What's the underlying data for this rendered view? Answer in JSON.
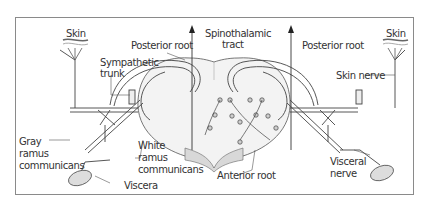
{
  "diagram": {
    "type": "anatomical cross-section of spinal cord with reflex pathways",
    "colors": {
      "frame": "#777777",
      "line": "#333333",
      "gray_matter": "#efefef",
      "white_matter": "#ffffff",
      "shading": "#cfcfcf"
    },
    "labels": {
      "skin_left": "Skin",
      "skin_right": "Skin",
      "spinothalamic_1": "Spinothalamic",
      "spinothalamic_2": "tract",
      "posterior_root_left": "Posterior root",
      "posterior_root_right": "Posterior root",
      "sympathetic_1": "Sympathetic",
      "sympathetic_2": "trunk",
      "skin_nerve": "Skin nerve",
      "gray_1": "Gray",
      "gray_2": "ramus",
      "gray_3": "communicans",
      "white_1": "White",
      "white_2": "ramus",
      "white_3": "communicans",
      "anterior_root": "Anterior root",
      "visceral_1": "Visceral",
      "visceral_2": "nerve",
      "viscera": "Viscera"
    }
  }
}
